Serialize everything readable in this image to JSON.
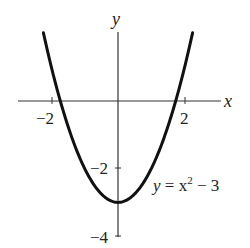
{
  "chart_data": {
    "type": "line",
    "title": "",
    "xlabel": "x",
    "ylabel": "y",
    "equation_label": {
      "y": "y",
      "eq": " = x",
      "exp": "2",
      "rest": " − 3"
    },
    "x_ticks": [
      {
        "value": -2,
        "label": "−2"
      },
      {
        "value": 2,
        "label": "2"
      }
    ],
    "y_ticks": [
      {
        "value": -2,
        "label": "−2"
      },
      {
        "value": -4,
        "label": "−4"
      }
    ],
    "xlim": [
      -3,
      3
    ],
    "ylim": [
      -4,
      2
    ],
    "grid": false,
    "series": [
      {
        "name": "y = x^2 - 3",
        "function": "x^2 - 3",
        "x_range": [
          -2.24,
          2.24
        ],
        "x": [
          -2.24,
          -2,
          -1.5,
          -1,
          -0.5,
          0,
          0.5,
          1,
          1.5,
          2,
          2.24
        ],
        "y": [
          2.02,
          1,
          -0.75,
          -2,
          -2.75,
          -3,
          -2.75,
          -2,
          -0.75,
          1,
          2.02
        ]
      }
    ]
  },
  "colors": {
    "curve": "#111111",
    "axis": "#333333",
    "text": "#222222"
  }
}
